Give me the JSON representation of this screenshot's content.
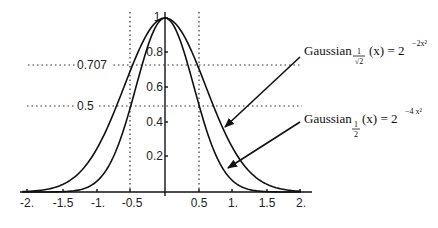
{
  "chart_data": {
    "type": "line",
    "title": "",
    "xlabel": "",
    "ylabel": "",
    "xlim": [
      -2.1,
      2.2
    ],
    "ylim": [
      0,
      1.05
    ],
    "grid": false,
    "x_ticks": [
      "-2.",
      "-1.5",
      "-1.",
      "-0.5",
      "0.5",
      "1.",
      "1.5",
      "2."
    ],
    "x_tick_values": [
      -2,
      -1.5,
      -1,
      -0.5,
      0.5,
      1,
      1.5,
      2
    ],
    "y_ticks": [
      "0.2",
      "0.4",
      "0.6",
      "0.8",
      "1"
    ],
    "y_tick_values": [
      0.2,
      0.4,
      0.6,
      0.8,
      1.0
    ],
    "reference_lines": {
      "horizontal": [
        {
          "y": 0.707,
          "label": "0.707",
          "style": "dotted"
        },
        {
          "y": 0.5,
          "label": "0.5",
          "style": "dotted"
        }
      ],
      "vertical": [
        {
          "x": -0.5,
          "style": "dotted"
        },
        {
          "x": 0.5,
          "style": "dotted"
        }
      ]
    },
    "series": [
      {
        "name": "Gaussian_{1/√2}(x) = 2^(-2x^2)",
        "formula": "2^(-2x^2)",
        "x": [
          -2,
          -1.75,
          -1.5,
          -1.25,
          -1,
          -0.75,
          -0.5,
          -0.25,
          0,
          0.25,
          0.5,
          0.75,
          1,
          1.25,
          1.5,
          1.75,
          2
        ],
        "values": [
          0.004,
          0.014,
          0.044,
          0.115,
          0.25,
          0.459,
          0.707,
          0.917,
          1.0,
          0.917,
          0.707,
          0.459,
          0.25,
          0.115,
          0.044,
          0.014,
          0.004
        ]
      },
      {
        "name": "Gaussian_{1/2}(x) = 2^(-4x^2)",
        "formula": "2^(-4x^2)",
        "x": [
          -2,
          -1.75,
          -1.5,
          -1.25,
          -1,
          -0.75,
          -0.5,
          -0.25,
          0,
          0.25,
          0.5,
          0.75,
          1,
          1.25,
          1.5,
          1.75,
          2
        ],
        "values": [
          0.0,
          0.0002,
          0.002,
          0.013,
          0.0625,
          0.21,
          0.5,
          0.841,
          1.0,
          0.841,
          0.5,
          0.21,
          0.0625,
          0.013,
          0.002,
          0.0002,
          0.0
        ]
      }
    ],
    "annotations": [
      {
        "text": "Gaussian",
        "subscript": "1/√2",
        "rest": "(x) = 2",
        "superscript": "−2x²",
        "points_to": "wider curve"
      },
      {
        "text": "Gaussian",
        "subscript": "1/2",
        "rest": "(x) = 2",
        "superscript": "−4x²",
        "points_to": "narrower curve"
      }
    ]
  },
  "labels": {
    "x_ticks": [
      "-2.",
      "-1.5",
      "-1.",
      "-0.5",
      "0.5",
      "1.",
      "1.5",
      "2."
    ],
    "y_ticks": [
      "0.2",
      "0.4",
      "0.6",
      "0.8",
      "1"
    ],
    "ref_0707": "0.707",
    "ref_05": "0.5",
    "legend1": {
      "base": "Gaussian",
      "sub_num": "1",
      "sub_den": "√2",
      "rest": "(x) = 2",
      "sup": "−2x²"
    },
    "legend2": {
      "base": "Gaussian",
      "sub_num": "1",
      "sub_den": "2",
      "rest": "(x) = 2",
      "sup": "−4 x²"
    }
  }
}
